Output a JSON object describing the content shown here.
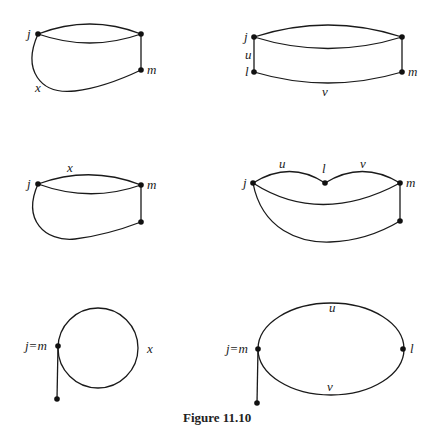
{
  "figure": {
    "caption": "Figure 11.10",
    "panels": [
      {
        "id": "top-left",
        "vertices": [
          "j",
          "m"
        ],
        "edge_labels": [
          "x"
        ]
      },
      {
        "id": "top-right",
        "vertices": [
          "j",
          "l",
          "m"
        ],
        "edge_labels": [
          "u",
          "v"
        ]
      },
      {
        "id": "middle-left",
        "vertices": [
          "j",
          "m"
        ],
        "edge_labels": [
          "x"
        ]
      },
      {
        "id": "middle-right",
        "vertices": [
          "j",
          "l",
          "m"
        ],
        "edge_labels": [
          "u",
          "v"
        ]
      },
      {
        "id": "bottom-left",
        "vertices": [
          "j=m"
        ],
        "edge_labels": [
          "x"
        ]
      },
      {
        "id": "bottom-right",
        "vertices": [
          "j=m",
          "l"
        ],
        "edge_labels": [
          "u",
          "v"
        ]
      }
    ]
  },
  "colors": {
    "ink": "#111111",
    "background": "#ffffff"
  }
}
